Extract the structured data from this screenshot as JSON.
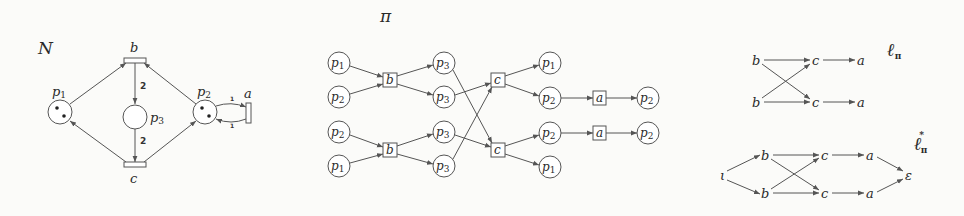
{
  "colors": {
    "stroke": "#555555",
    "text": "#2a2a2a",
    "background": "#fbfbf9"
  },
  "net_N": {
    "title": "N",
    "places": [
      {
        "id": "p1",
        "name": "p",
        "sub": "1",
        "tokens": 2,
        "x": 60,
        "y": 112
      },
      {
        "id": "p3",
        "name": "p",
        "sub": "3",
        "tokens": 0,
        "x": 135,
        "y": 117
      },
      {
        "id": "p2",
        "name": "p",
        "sub": "2",
        "tokens": 2,
        "x": 205,
        "y": 112
      }
    ],
    "transitions": [
      {
        "id": "b",
        "label": "b"
      },
      {
        "id": "c",
        "label": "c"
      },
      {
        "id": "a",
        "label": "a"
      }
    ],
    "weights": {
      "b_p3": "2",
      "p3_c": "2",
      "p2_a": "1",
      "a_p2": "1"
    }
  },
  "process_pi": {
    "title": "π",
    "col1": [
      {
        "name": "p",
        "sub": "1"
      },
      {
        "name": "p",
        "sub": "2"
      },
      {
        "name": "p",
        "sub": "2"
      },
      {
        "name": "p",
        "sub": "1"
      }
    ],
    "b_events": [
      {
        "label": "b"
      },
      {
        "label": "b"
      }
    ],
    "col2": [
      {
        "name": "p",
        "sub": "3"
      },
      {
        "name": "p",
        "sub": "3"
      },
      {
        "name": "p",
        "sub": "3"
      },
      {
        "name": "p",
        "sub": "3"
      }
    ],
    "c_events": [
      {
        "label": "c"
      },
      {
        "label": "c"
      }
    ],
    "col3": [
      {
        "name": "p",
        "sub": "1"
      },
      {
        "name": "p",
        "sub": "2"
      },
      {
        "name": "p",
        "sub": "2"
      },
      {
        "name": "p",
        "sub": "1"
      }
    ],
    "a_events": [
      {
        "label": "a"
      },
      {
        "label": "a"
      }
    ],
    "col4": [
      {
        "name": "p",
        "sub": "2"
      },
      {
        "name": "p",
        "sub": "2"
      }
    ]
  },
  "lpo_l": {
    "title": "ℓ",
    "title_sub": "π",
    "nodes": {
      "b1": "b",
      "b2": "b",
      "c1": "c",
      "c2": "c",
      "a1": "a",
      "a2": "a"
    }
  },
  "lpo_lstar": {
    "title": "ℓ",
    "title_sub": "π",
    "title_sup": "*",
    "nodes": {
      "iota": "ι",
      "b1": "b",
      "b2": "b",
      "c1": "c",
      "c2": "c",
      "a1": "a",
      "a2": "a",
      "eps": "ε"
    }
  }
}
